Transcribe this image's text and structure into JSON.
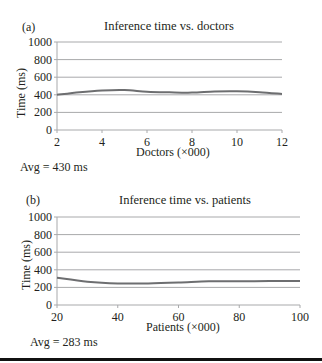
{
  "chart_data": [
    {
      "type": "line",
      "panel": "(a)",
      "title": "Inference time vs. doctors",
      "xlabel": "Doctors (×000)",
      "ylabel": "Time (ms)",
      "x": [
        2,
        3,
        4,
        5,
        6,
        7,
        8,
        9,
        10,
        11,
        12
      ],
      "series": [
        {
          "name": "Inference time",
          "values": [
            400,
            430,
            450,
            455,
            435,
            428,
            425,
            438,
            440,
            430,
            410
          ]
        }
      ],
      "xticks": [
        2,
        4,
        6,
        8,
        10,
        12
      ],
      "yticks": [
        0,
        200,
        400,
        600,
        800,
        1000
      ],
      "xlim": [
        2,
        12
      ],
      "ylim": [
        0,
        1000
      ],
      "grid": true,
      "annotation": "Avg = 430 ms"
    },
    {
      "type": "line",
      "panel": "(b)",
      "title": "Inference time vs. patients",
      "xlabel": "Patients (×000)",
      "ylabel": "Time (ms)",
      "x": [
        20,
        30,
        40,
        50,
        60,
        70,
        80,
        90,
        100
      ],
      "series": [
        {
          "name": "Inference time",
          "values": [
            310,
            265,
            245,
            245,
            255,
            270,
            270,
            272,
            272
          ]
        }
      ],
      "xticks": [
        20,
        40,
        60,
        80,
        100
      ],
      "yticks": [
        0,
        200,
        400,
        600,
        800,
        1000
      ],
      "xlim": [
        20,
        100
      ],
      "ylim": [
        0,
        1000
      ],
      "grid": true,
      "annotation": "Avg = 283 ms"
    }
  ],
  "colors": {
    "line": "#6d6e70",
    "grid": "#a8a9ab",
    "axis": "#a8a9ab",
    "text": "#231f20"
  }
}
